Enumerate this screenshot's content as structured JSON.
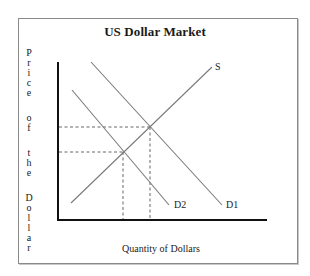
{
  "chart_data": {
    "type": "line",
    "title": "US Dollar Market",
    "xlabel": "Quantity of Dollars",
    "ylabel": "Price of the Dollar",
    "ylabel_words": [
      "Price",
      "of",
      "the",
      "Dollar"
    ],
    "grid": false,
    "legend": "inline labels at line ends",
    "axis_ticks": "none",
    "series": [
      {
        "name": "S",
        "kind": "supply",
        "slope": "upward",
        "points": [
          [
            71,
            203
          ],
          [
            212,
            67
          ]
        ],
        "label_pos": [
          215,
          61
        ]
      },
      {
        "name": "D1",
        "kind": "demand",
        "slope": "downward",
        "points": [
          [
            91,
            62
          ],
          [
            222,
            205
          ]
        ],
        "label_pos": [
          226,
          199
        ]
      },
      {
        "name": "D2",
        "kind": "demand",
        "slope": "downward",
        "points": [
          [
            72,
            90
          ],
          [
            169,
            205
          ]
        ],
        "label_pos": [
          174,
          199
        ]
      }
    ],
    "equilibria": [
      {
        "name": "E1",
        "between": [
          "S",
          "D1"
        ],
        "point": [
          150,
          127
        ],
        "note": "higher price, higher quantity"
      },
      {
        "name": "E2",
        "between": [
          "S",
          "D2"
        ],
        "point": [
          123,
          152
        ],
        "note": "lower price, lower quantity"
      }
    ],
    "annotations": "Dashed guide lines from each equilibrium to both axes; demand shifts left from D1 to D2"
  },
  "colors": {
    "axis": "#111111",
    "curve": "#7a7a7a",
    "dashed": "#555555",
    "text": "#1a1a1a",
    "frame": "#8a8a8a"
  }
}
